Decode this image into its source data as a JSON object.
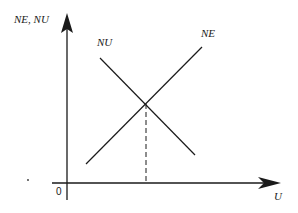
{
  "diagram": {
    "y_axis_label": "NE, NU",
    "x_axis_label": "U",
    "origin_label": "0",
    "curves": [
      {
        "name": "NU",
        "label": "NU",
        "slope": "downward"
      },
      {
        "name": "NE",
        "label": "NE",
        "slope": "upward"
      }
    ],
    "equilibrium_marker": "dashed vertical line from intersection to U-axis",
    "colors": {
      "line": "#1a1a1a",
      "background": "#ffffff"
    }
  }
}
